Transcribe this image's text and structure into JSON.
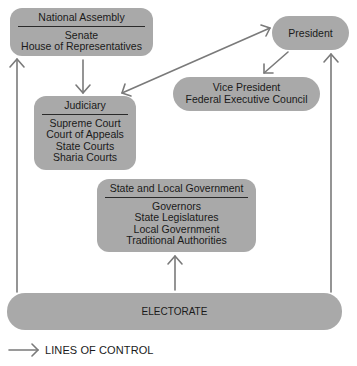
{
  "diagram": {
    "nodes": {
      "national_assembly": {
        "title": "National Assembly",
        "items": [
          "Senate",
          "House of Representatives"
        ]
      },
      "president": {
        "title": "President"
      },
      "vice_president": {
        "items": [
          "Vice President",
          "Federal Executive Council"
        ]
      },
      "judiciary": {
        "title": "Judiciary",
        "items": [
          "Supreme Court",
          "Court of Appeals",
          "State Courts",
          "Sharia Courts"
        ]
      },
      "state_local": {
        "title": "State and Local Government",
        "items": [
          "Governors",
          "State Legislatures",
          "Local Government",
          "Traditional Authorities"
        ]
      },
      "electorate": {
        "title": "ELECTORATE"
      }
    },
    "edges": [
      {
        "from": "Electorate",
        "to": "National Assembly"
      },
      {
        "from": "Electorate",
        "to": "State and Local Government"
      },
      {
        "from": "Electorate",
        "to": "President"
      },
      {
        "from": "National Assembly",
        "to": "Judiciary"
      },
      {
        "from": "President",
        "to": "Vice President / Federal Executive Council"
      },
      {
        "from": "Judiciary",
        "to": "President",
        "bidirectional": true
      }
    ],
    "legend": {
      "label": "LINES OF CONTROL"
    },
    "colors": {
      "box_fill": "#a9a9a9",
      "arrow": "#7a7a7a",
      "text": "#1a1a1a"
    }
  }
}
